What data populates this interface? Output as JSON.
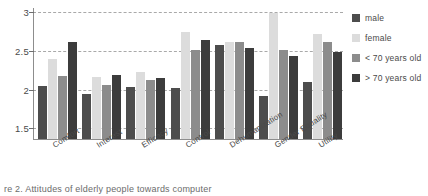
{
  "chart_data": {
    "type": "bar",
    "title": "",
    "xlabel": "",
    "ylabel": "",
    "ylim": [
      1.35,
      3.05
    ],
    "yticks": [
      1.5,
      2,
      2.5,
      3
    ],
    "ytick_labels": [
      "1.5",
      "2",
      "2.5",
      "3"
    ],
    "grid": true,
    "grid_style": "dashed-horizontal",
    "legend_position": "right",
    "categories": [
      "Comfort",
      "Interest",
      "Efficacy",
      "Control",
      "Dehumanization",
      "Gender Equality",
      "Utility"
    ],
    "series": [
      {
        "name": "male",
        "color": "#4d4d4d",
        "values": [
          2.03,
          1.93,
          2.02,
          2.01,
          2.56,
          1.9,
          2.08
        ]
      },
      {
        "name": "female",
        "color": "#dcdcdc",
        "values": [
          2.38,
          2.15,
          2.21,
          2.73,
          2.6,
          2.97,
          2.7
        ]
      },
      {
        "name": "< 70 years old",
        "color": "#8c8c8c",
        "values": [
          2.16,
          2.04,
          2.11,
          2.5,
          2.6,
          2.5,
          2.6
        ]
      },
      {
        "name": "> 70 years old",
        "color": "#3c3c3c",
        "values": [
          2.6,
          2.18,
          2.14,
          2.63,
          2.52,
          2.42,
          2.47
        ]
      }
    ]
  },
  "legend": {
    "entries": [
      {
        "label": "male",
        "color": "#4d4d4d"
      },
      {
        "label": "female",
        "color": "#dcdcdc"
      },
      {
        "label": "< 70 years old",
        "color": "#8c8c8c"
      },
      {
        "label": "> 70 years old",
        "color": "#3c3c3c"
      }
    ]
  },
  "caption": {
    "text": "re 2. Attitudes of elderly people towards computer"
  }
}
